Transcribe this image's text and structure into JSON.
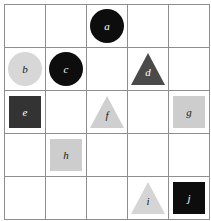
{
  "figure": {
    "name": "shape-grid-figure",
    "grid": {
      "rows": 5,
      "cols": 5
    },
    "background_color": "#ffffff",
    "grid_line_color": "#8e8e8e"
  },
  "shapes": [
    {
      "id": "a",
      "label": "a",
      "shape": "circle",
      "row": 1,
      "col": 3,
      "fill": "#0d0d0d",
      "text_color": "#ffffff"
    },
    {
      "id": "b",
      "label": "b",
      "shape": "circle",
      "row": 2,
      "col": 1,
      "fill": "#d7d7d7",
      "text_color": "#1a1a1a"
    },
    {
      "id": "c",
      "label": "c",
      "shape": "circle",
      "row": 2,
      "col": 2,
      "fill": "#0d0d0d",
      "text_color": "#ffffff"
    },
    {
      "id": "d",
      "label": "d",
      "shape": "triangle",
      "row": 2,
      "col": 4,
      "fill": "#4a4a4a",
      "text_color": "#ffffff"
    },
    {
      "id": "e",
      "label": "e",
      "shape": "square",
      "row": 3,
      "col": 1,
      "fill": "#333333",
      "text_color": "#ffffff"
    },
    {
      "id": "f",
      "label": "f",
      "shape": "triangle",
      "row": 3,
      "col": 3,
      "fill": "#cfcfcf",
      "text_color": "#1a1a1a"
    },
    {
      "id": "g",
      "label": "g",
      "shape": "square",
      "row": 3,
      "col": 5,
      "fill": "#cdcdcd",
      "text_color": "#1a1a1a"
    },
    {
      "id": "h",
      "label": "h",
      "shape": "square",
      "row": 4,
      "col": 2,
      "fill": "#cdcdcd",
      "text_color": "#1a1a1a"
    },
    {
      "id": "i",
      "label": "i",
      "shape": "triangle",
      "row": 5,
      "col": 4,
      "fill": "#d5d5d5",
      "text_color": "#1a1a1a"
    },
    {
      "id": "j",
      "label": "j",
      "shape": "square",
      "row": 5,
      "col": 5,
      "fill": "#0d0d0d",
      "text_color": "#ffffff"
    }
  ]
}
